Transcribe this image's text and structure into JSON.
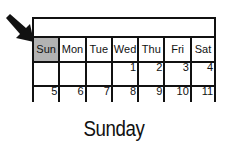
{
  "calendar": {
    "title": "",
    "days": [
      "Sun",
      "Mon",
      "Tue",
      "Wed",
      "Thu",
      "Fri",
      "Sat"
    ],
    "highlighted_day": "Sun",
    "weeks": [
      [
        "",
        "",
        "",
        "1",
        "2",
        "3",
        "4"
      ],
      [
        "5",
        "6",
        "7",
        "8",
        "9",
        "10",
        "11"
      ]
    ]
  },
  "caption": "Sunday",
  "colors": {
    "highlight": "#b3b3b3",
    "line": "#111111"
  },
  "icons": {
    "pointer": "arrow-pointing-icon"
  }
}
